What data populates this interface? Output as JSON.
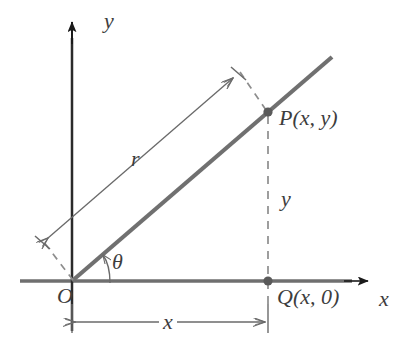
{
  "figure": {
    "caption_title": "Polar coordinate relationship diagram"
  },
  "labels": {
    "axis_y": "y",
    "axis_x": "x",
    "origin": "O",
    "point_p": "P(x, y)",
    "point_q": "Q(x, 0)",
    "radius": "r",
    "side_y": "y",
    "side_x": "x",
    "theta": "θ"
  },
  "colors": {
    "ray": "#707070",
    "axis_line": "#6f6f6f",
    "arrowhead": "#1a1a1a",
    "dimension": "#6a6a6a",
    "dashed": "#8d8d8d",
    "point_marker": "#5a5a5a",
    "y_axis": "#2b2b2b",
    "label_text": "#3d3d3d",
    "background": "#ffffff"
  },
  "geometry": {
    "origin": {
      "x": 72,
      "y": 281
    },
    "point_p": {
      "x": 268,
      "y": 112
    },
    "point_q": {
      "x": 268,
      "y": 281
    },
    "ray_end": {
      "x": 332,
      "y": 57
    },
    "x_axis": {
      "start_x": 20,
      "end_x": 370,
      "y": 281
    },
    "y_axis": {
      "x": 72,
      "top_y": 22,
      "bottom_y": 331
    },
    "theta_degrees": 40,
    "radius_dimension": {
      "from": {
        "x": 42,
        "y": 243
      },
      "to": {
        "x": 238,
        "y": 74
      }
    },
    "x_dimension": {
      "from": {
        "x": 72,
        "y": 322
      },
      "to": {
        "x": 268,
        "y": 322
      }
    }
  }
}
